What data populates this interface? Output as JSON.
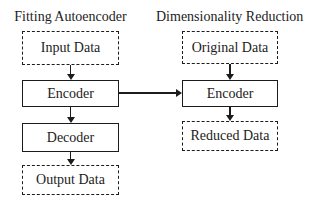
{
  "diagram": {
    "colors": {
      "stroke": "#1c1c1c",
      "text": "#1c1c1c",
      "background": "#ffffff"
    },
    "left": {
      "title": "Fitting Autoencoder",
      "nodes": [
        {
          "label": "Input Data",
          "border": "dashed"
        },
        {
          "label": "Encoder",
          "border": "solid"
        },
        {
          "label": "Decoder",
          "border": "solid"
        },
        {
          "label": "Output Data",
          "border": "dashed"
        }
      ]
    },
    "right": {
      "title": "Dimensionality Reduction",
      "nodes": [
        {
          "label": "Original Data",
          "border": "dashed"
        },
        {
          "label": "Encoder",
          "border": "solid"
        },
        {
          "label": "Reduced Data",
          "border": "dashed"
        }
      ]
    },
    "edges": [
      {
        "from": "Input Data",
        "to": "Encoder (left)",
        "direction": "down"
      },
      {
        "from": "Encoder (left)",
        "to": "Decoder",
        "direction": "down"
      },
      {
        "from": "Decoder",
        "to": "Output Data",
        "direction": "down"
      },
      {
        "from": "Encoder (left)",
        "to": "Encoder (right)",
        "direction": "right"
      },
      {
        "from": "Original Data",
        "to": "Encoder (right)",
        "direction": "down"
      },
      {
        "from": "Encoder (right)",
        "to": "Reduced Data",
        "direction": "down"
      }
    ]
  }
}
